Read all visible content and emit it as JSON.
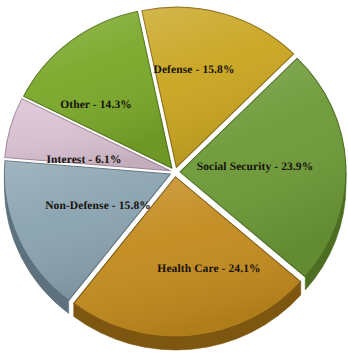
{
  "chart_data": {
    "type": "pie",
    "title": "",
    "subtitle": "",
    "xlabel": "",
    "ylabel": "",
    "legend_position": "none",
    "grid": false,
    "style": "3d-exploded-pie",
    "background_color": "#ffffff",
    "label_format": "{name} - {value}%",
    "categories": [
      "Defense",
      "Social Security",
      "Health Care",
      "Non-Defense",
      "Interest",
      "Other"
    ],
    "values": [
      15.8,
      23.9,
      24.1,
      15.8,
      6.1,
      14.3
    ],
    "slices": [
      {
        "name": "Defense",
        "value": 15.8,
        "label": "Defense - 15.8%",
        "color": "#c9a520",
        "edge_color": "#8e6c12",
        "start_angle": 348.0,
        "end_angle": 404.9,
        "label_x": 194,
        "label_y": 70
      },
      {
        "name": "Social Security",
        "value": 23.9,
        "label": "Social Security - 23.9%",
        "color": "#6d9a37",
        "edge_color": "#4c6d22",
        "start_angle": 44.9,
        "end_angle": 131.0,
        "label_x": 255,
        "label_y": 167
      },
      {
        "name": "Health Care",
        "value": 24.1,
        "label": "Health Care - 24.1%",
        "color": "#c38b1e",
        "edge_color": "#7d5710",
        "start_angle": 131.0,
        "end_angle": 217.8,
        "label_x": 209,
        "label_y": 269
      },
      {
        "name": "Non-Defense",
        "value": 15.8,
        "label": "Non-Defense - 15.8%",
        "color": "#8aa3b0",
        "edge_color": "#5d727e",
        "start_angle": 217.8,
        "end_angle": 274.7,
        "label_x": 98,
        "label_y": 206
      },
      {
        "name": "Interest",
        "value": 6.1,
        "label": "Interest - 6.1%",
        "color": "#d9c0d2",
        "edge_color": "#a58c9e",
        "start_angle": 274.7,
        "end_angle": 296.7,
        "label_x": 84,
        "label_y": 160
      },
      {
        "name": "Other",
        "value": 14.3,
        "label": "Other - 14.3%",
        "color": "#7aa829",
        "edge_color": "#55761a",
        "start_angle": 296.7,
        "end_angle": 348.0,
        "label_x": 96,
        "label_y": 105
      }
    ],
    "total": 100.0,
    "center_x": 175,
    "center_y": 172,
    "radius": 166
  }
}
